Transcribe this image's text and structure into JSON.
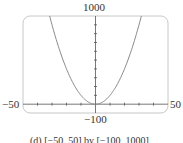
{
  "chart_data": {
    "type": "line",
    "title": "",
    "caption": "(d) [−50, 50] by [−100, 1000]",
    "function": "y = x^2",
    "xlim": [
      -50,
      50
    ],
    "ylim": [
      -100,
      1000
    ],
    "xlabel": "",
    "ylabel": "",
    "tick_labels": {
      "x_min": "−50",
      "x_max": "50",
      "y_min": "−100",
      "y_max": "1000"
    },
    "x_tick_step": 10,
    "y_tick_step": 100,
    "grid": false,
    "series": [
      {
        "name": "y = x^2",
        "x": [
          -31.6,
          -30,
          -25,
          -20,
          -15,
          -10,
          -5,
          0,
          5,
          10,
          15,
          20,
          25,
          30,
          31.6
        ],
        "y": [
          1000,
          900,
          625,
          400,
          225,
          100,
          25,
          0,
          25,
          100,
          225,
          400,
          625,
          900,
          1000
        ]
      }
    ],
    "colors": {
      "curve": "#8a8a8a",
      "frame": "#c8c8c8",
      "axis": "#555555"
    }
  }
}
